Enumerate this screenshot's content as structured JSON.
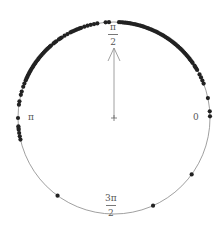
{
  "chart_data": {
    "type": "scatter",
    "subtype": "circular",
    "title": "",
    "angle_labels": {
      "0": "0",
      "half_pi": {
        "num": "π",
        "den": "2"
      },
      "pi": "π",
      "three_half_pi": {
        "num": "3π",
        "den": "2"
      }
    },
    "mean_direction_deg": 90,
    "mean_resultant_length": 0.73,
    "points_deg": [
      1,
      4,
      12,
      21,
      23,
      25,
      27,
      30,
      31,
      32,
      33,
      35,
      36,
      37,
      38,
      39,
      40,
      41,
      42,
      43,
      44,
      45,
      46,
      47,
      48,
      49,
      50,
      51,
      52,
      53,
      54,
      55,
      56,
      57,
      58,
      59,
      60,
      61,
      62,
      63,
      64,
      65,
      66,
      67,
      68,
      69,
      70,
      71,
      72,
      73,
      74,
      75,
      76,
      77,
      78,
      79,
      80,
      81,
      82,
      83,
      84,
      85,
      86,
      87,
      93,
      95,
      100,
      102,
      104,
      106,
      108,
      110,
      111,
      112,
      113,
      114,
      115,
      116,
      117,
      119,
      121,
      123,
      124,
      125,
      127,
      128,
      129,
      131,
      132,
      133,
      134,
      135,
      136,
      137,
      138,
      139,
      140,
      141,
      142,
      143,
      144,
      145,
      146,
      147,
      148,
      149,
      150,
      151,
      152,
      153,
      154,
      155,
      156,
      157,
      159,
      161,
      164,
      166,
      170,
      172,
      180,
      185,
      186,
      187,
      189,
      191,
      193,
      234,
      294,
      324
    ],
    "colors": {
      "circle": "#888888",
      "point": "#222222",
      "arrow": "#888888"
    }
  }
}
